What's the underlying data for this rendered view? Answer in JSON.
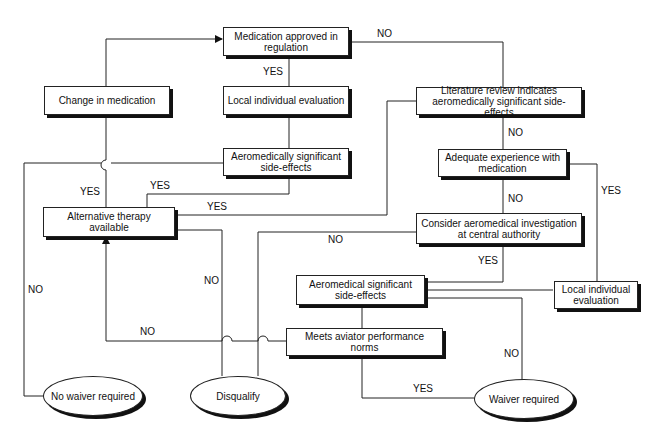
{
  "nodes": {
    "medication_approved": "Medication approved in regulation",
    "change_in_medication": "Change in medication",
    "local_eval_top": "Local individual evaluation",
    "aero_sig_side_effects_1": "Aeromedically significant side-effects",
    "literature_review": "Literature review indicates aeromedically significant side-effects",
    "adequate_experience": "Adequate experience with medication",
    "alternative_therapy": "Alternative therapy available",
    "consider_investigation": "Consider aeromedical investigation at central authority",
    "aero_sig_side_effects_2": "Aeromedical significant side-effects",
    "local_eval_right": "Local individual evaluation",
    "meets_norms": "Meets aviator performance norms",
    "no_waiver": "No waiver required",
    "disqualify": "Disqualify",
    "waiver_required": "Waiver required"
  },
  "labels": {
    "no_top": "NO",
    "yes_approved": "YES",
    "no_literature": "NO",
    "yes_change": "YES",
    "yes_side1": "YES",
    "yes_literature": "YES",
    "no_adequate": "NO",
    "yes_adequate": "YES",
    "no_consider": "NO",
    "yes_consider": "YES",
    "no_alt_left": "NO",
    "no_disq": "NO",
    "no_meets": "NO",
    "no_waiver_side": "NO",
    "yes_meets": "YES"
  },
  "colors": {
    "line": "#222222",
    "shadow": "#111111",
    "background": "#ffffff"
  }
}
